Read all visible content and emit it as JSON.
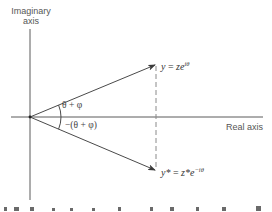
{
  "diagram": {
    "axes": {
      "vertical_label_line1": "Imaginary",
      "vertical_label_line2": "axis",
      "horizontal_label": "Real axis"
    },
    "vectors": {
      "upper": {
        "lhs": "y",
        "eq": " = ",
        "base": "ze",
        "exp": "iθ"
      },
      "lower": {
        "lhs": "y*",
        "eq": " = ",
        "base": "z*e",
        "exp": "−iθ"
      }
    },
    "angles": {
      "upper": "θ + φ",
      "lower": "−(θ + φ)"
    },
    "colors": {
      "line": "#5a5a5a",
      "dashed": "#8a8a8a",
      "text": "#444444"
    }
  }
}
